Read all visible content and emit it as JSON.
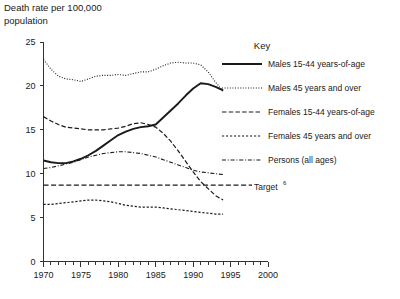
{
  "chart_data": {
    "type": "line",
    "title": "",
    "ylabel": "Death rate per 100,000 population",
    "xlabel": "",
    "xlim": [
      1970,
      2000
    ],
    "ylim": [
      0,
      25
    ],
    "yticks": [
      0,
      5,
      10,
      15,
      20,
      25
    ],
    "xticks": [
      1970,
      1975,
      1980,
      1985,
      1990,
      1995,
      2000
    ],
    "x_minor_tick_step": 1,
    "grid": false,
    "legend_position": "right",
    "legend_title": "Key",
    "annotations": [
      {
        "text": "Target",
        "superscript": "6",
        "value": 8.7
      }
    ],
    "x": [
      1970,
      1971,
      1972,
      1973,
      1974,
      1975,
      1976,
      1977,
      1978,
      1979,
      1980,
      1981,
      1982,
      1983,
      1984,
      1985,
      1986,
      1987,
      1988,
      1989,
      1990,
      1991,
      1992,
      1993,
      1994
    ],
    "series": [
      {
        "name": "Males 15-44 years-of-age",
        "style": "solid",
        "values": [
          11.5,
          11.3,
          11.2,
          11.2,
          11.4,
          11.7,
          12.1,
          12.6,
          13.2,
          13.8,
          14.4,
          14.8,
          15.1,
          15.3,
          15.4,
          15.6,
          16.4,
          17.2,
          18.0,
          18.9,
          19.7,
          20.3,
          20.2,
          19.9,
          19.5
        ]
      },
      {
        "name": "Males 45 years and over",
        "style": "dotted",
        "values": [
          23.0,
          21.9,
          21.1,
          20.8,
          20.7,
          20.5,
          20.8,
          21.1,
          21.2,
          21.2,
          21.3,
          21.2,
          21.4,
          21.6,
          21.6,
          21.9,
          22.3,
          22.6,
          22.7,
          22.6,
          22.6,
          22.4,
          21.6,
          20.4,
          19.4
        ]
      },
      {
        "name": "Females 15-44 years-of-age",
        "style": "dashed-long",
        "values": [
          16.5,
          16.0,
          15.6,
          15.3,
          15.2,
          15.1,
          15.0,
          15.0,
          15.0,
          15.1,
          15.2,
          15.4,
          15.7,
          15.8,
          15.6,
          15.3,
          14.6,
          13.7,
          12.6,
          11.4,
          10.2,
          9.1,
          8.3,
          7.5,
          7.0
        ]
      },
      {
        "name": "Females 45 years and over",
        "style": "dashed-fine",
        "values": [
          6.5,
          6.5,
          6.6,
          6.7,
          6.8,
          6.9,
          7.0,
          7.0,
          6.9,
          6.8,
          6.6,
          6.4,
          6.3,
          6.2,
          6.2,
          6.2,
          6.1,
          6.0,
          5.9,
          5.8,
          5.7,
          5.6,
          5.5,
          5.4,
          5.4
        ]
      },
      {
        "name": "Persons (all ages)",
        "style": "dash-dot",
        "values": [
          10.6,
          10.7,
          10.9,
          11.1,
          11.3,
          11.6,
          11.9,
          12.1,
          12.3,
          12.4,
          12.5,
          12.5,
          12.4,
          12.3,
          12.1,
          11.9,
          11.6,
          11.3,
          11.0,
          10.7,
          10.4,
          10.2,
          10.1,
          10.0,
          9.9
        ]
      }
    ]
  },
  "legend": {
    "title": "Key",
    "items": [
      {
        "label": "Males 15-44 years-of-age",
        "style": "solid"
      },
      {
        "label": "Males 45 years and over",
        "style": "dotted"
      },
      {
        "label": "Females 15-44 years-of-age",
        "style": "dashed-long"
      },
      {
        "label": "Females 45 years and over",
        "style": "dashed-fine"
      },
      {
        "label": "Persons (all ages)",
        "style": "dash-dot"
      }
    ]
  },
  "axis": {
    "y_title_line1": "Death rate per 100,000",
    "y_title_line2": "population"
  },
  "target": {
    "label": "Target",
    "superscript": "6",
    "value": 8.7
  },
  "colors": {
    "ink": "#1a1a1a",
    "axis": "#333333",
    "background": "#ffffff"
  }
}
